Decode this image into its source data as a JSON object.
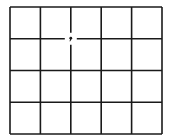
{
  "grid": {
    "columns": 5,
    "rows": 4,
    "left": 10,
    "top": 7,
    "right": 162,
    "bottom": 134,
    "line_color": "#1a1a1a",
    "gap": {
      "col_line": 2,
      "row_line": 1,
      "radius": 6,
      "marker": "dot"
    }
  }
}
